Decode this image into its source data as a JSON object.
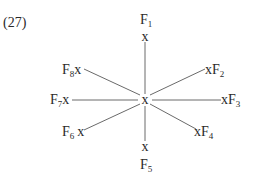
{
  "example_number": "(27)",
  "center_marker": "x",
  "node_marker": "x",
  "nodes": [
    {
      "id": "F1",
      "letter": "F",
      "sub": "1",
      "direction": "north"
    },
    {
      "id": "F2",
      "letter": "F",
      "sub": "2",
      "direction": "north-east"
    },
    {
      "id": "F3",
      "letter": "F",
      "sub": "3",
      "direction": "east"
    },
    {
      "id": "F4",
      "letter": "F",
      "sub": "4",
      "direction": "south-east"
    },
    {
      "id": "F5",
      "letter": "F",
      "sub": "5",
      "direction": "south"
    },
    {
      "id": "F6",
      "letter": "F",
      "sub": "6",
      "direction": "south-west"
    },
    {
      "id": "F7",
      "letter": "F",
      "sub": "7",
      "direction": "west"
    },
    {
      "id": "F8",
      "letter": "F",
      "sub": "8",
      "direction": "north-west"
    }
  ]
}
